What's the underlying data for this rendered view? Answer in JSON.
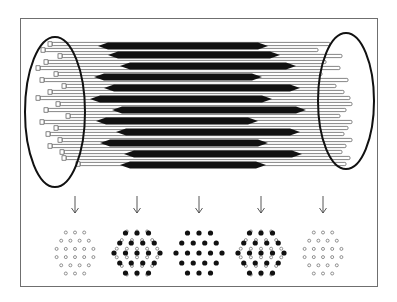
{
  "figure": {
    "colors": {
      "frame": "#6f6f6f",
      "ink": "#111111",
      "background": "#ffffff",
      "open_filament": "#ffffff"
    }
  },
  "cylinder": {
    "left_end": {
      "cx": 55,
      "cy": 112,
      "rx": 30,
      "ry": 75
    },
    "right_end": {
      "cx": 346,
      "cy": 101,
      "rx": 28,
      "ry": 68
    },
    "open_filaments": [
      {
        "y": 44,
        "x1": 52,
        "x2": 330
      },
      {
        "y": 50,
        "x1": 45,
        "x2": 318
      },
      {
        "y": 56,
        "x1": 62,
        "x2": 342
      },
      {
        "y": 62,
        "x1": 48,
        "x2": 326
      },
      {
        "y": 68,
        "x1": 40,
        "x2": 340
      },
      {
        "y": 74,
        "x1": 58,
        "x2": 322
      },
      {
        "y": 80,
        "x1": 44,
        "x2": 348
      },
      {
        "y": 86,
        "x1": 66,
        "x2": 336
      },
      {
        "y": 92,
        "x1": 52,
        "x2": 344
      },
      {
        "y": 98,
        "x1": 40,
        "x2": 350
      },
      {
        "y": 104,
        "x1": 60,
        "x2": 352
      },
      {
        "y": 110,
        "x1": 48,
        "x2": 346
      },
      {
        "y": 116,
        "x1": 70,
        "x2": 340
      },
      {
        "y": 122,
        "x1": 44,
        "x2": 352
      },
      {
        "y": 128,
        "x1": 58,
        "x2": 348
      },
      {
        "y": 134,
        "x1": 50,
        "x2": 344
      },
      {
        "y": 140,
        "x1": 62,
        "x2": 352
      },
      {
        "y": 146,
        "x1": 52,
        "x2": 346
      },
      {
        "y": 152,
        "x1": 64,
        "x2": 342
      },
      {
        "y": 158,
        "x1": 66,
        "x2": 350
      },
      {
        "y": 164,
        "x1": 80,
        "x2": 346
      }
    ],
    "solid_filaments": [
      {
        "y": 46,
        "x1": 98,
        "x2": 268
      },
      {
        "y": 55,
        "x1": 108,
        "x2": 280
      },
      {
        "y": 66,
        "x1": 120,
        "x2": 296
      },
      {
        "y": 77,
        "x1": 94,
        "x2": 262
      },
      {
        "y": 88,
        "x1": 104,
        "x2": 300
      },
      {
        "y": 99,
        "x1": 90,
        "x2": 272
      },
      {
        "y": 110,
        "x1": 112,
        "x2": 306
      },
      {
        "y": 121,
        "x1": 96,
        "x2": 258
      },
      {
        "y": 132,
        "x1": 116,
        "x2": 300
      },
      {
        "y": 143,
        "x1": 100,
        "x2": 268
      },
      {
        "y": 154,
        "x1": 124,
        "x2": 302
      },
      {
        "y": 165,
        "x1": 120,
        "x2": 266
      }
    ]
  },
  "arrows": [
    {
      "x": 75,
      "y1": 196,
      "y2": 213
    },
    {
      "x": 137,
      "y1": 196,
      "y2": 213
    },
    {
      "x": 199,
      "y1": 196,
      "y2": 213
    },
    {
      "x": 261,
      "y1": 196,
      "y2": 213
    },
    {
      "x": 323,
      "y1": 196,
      "y2": 213
    }
  ],
  "cross_sections": [
    {
      "label": "open-only",
      "cx": 75,
      "cy": 253,
      "open": true,
      "solid": false
    },
    {
      "label": "mixed",
      "cx": 137,
      "cy": 253,
      "open": true,
      "solid": true
    },
    {
      "label": "solid-only",
      "cx": 199,
      "cy": 253,
      "open": false,
      "solid": true
    },
    {
      "label": "mixed",
      "cx": 261,
      "cy": 253,
      "open": true,
      "solid": true
    },
    {
      "label": "open-only",
      "cx": 323,
      "cy": 253,
      "open": true,
      "solid": false
    }
  ]
}
